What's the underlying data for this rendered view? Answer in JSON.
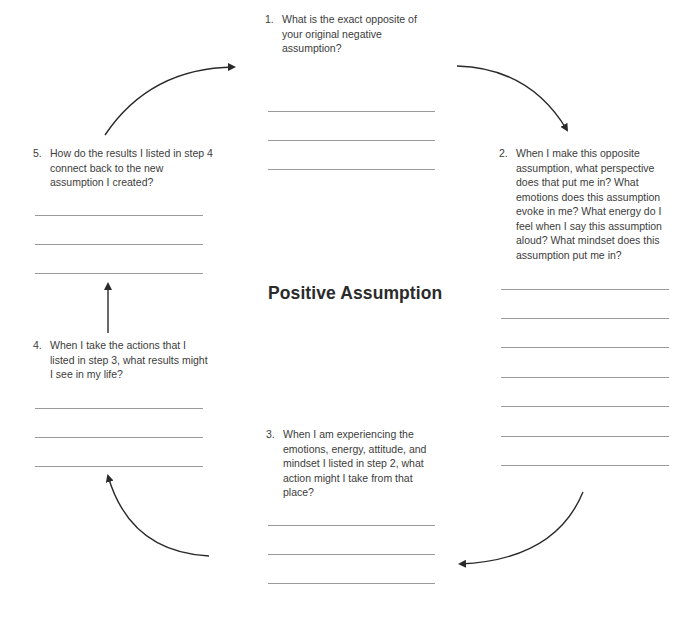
{
  "title": "Positive Assumption",
  "steps": [
    {
      "num": "1.",
      "text": "What is the exact opposite of your original negative assumption?",
      "blank_lines": 3
    },
    {
      "num": "2.",
      "text": "When I make this opposite assumption, what perspective does that put me in? What emotions does this assumption evoke in me? What energy do I feel when I say this assumption aloud? What mindset does this assumption put me in?",
      "blank_lines": 7
    },
    {
      "num": "3.",
      "text": "When I am experiencing the emotions, energy, attitude, and mindset I listed in step 2, what action might I take from that place?",
      "blank_lines": 3
    },
    {
      "num": "4.",
      "text": "When I take the actions that I listed in step 3, what results might I see in my life?",
      "blank_lines": 3
    },
    {
      "num": "5.",
      "text": "How do the results I listed in step 4 connect back to the new assumption I created?",
      "blank_lines": 3
    }
  ],
  "colors": {
    "text": "#3c3c3c",
    "rule": "#9a9a9a",
    "arrow": "#2a2a2a"
  }
}
